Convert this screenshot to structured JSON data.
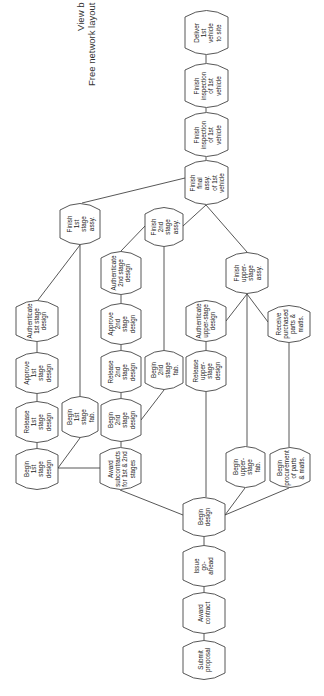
{
  "title": {
    "line1": "View b",
    "line2": "Free network layout"
  },
  "colors": {
    "stroke": "#444444",
    "text": "#222222",
    "background": "#ffffff"
  },
  "nodes": [
    {
      "id": "deliver",
      "label": "Deliver\n1st vehicle\nto site",
      "x": 185,
      "y": 10,
      "w": 43,
      "h": 45
    },
    {
      "id": "inspect1",
      "label": "Finish\ninspection\nof 1st\nvehicle",
      "x": 185,
      "y": 63,
      "w": 43,
      "h": 45
    },
    {
      "id": "inspect2",
      "label": "Finish\ninspection\nof 1st\nvehicle",
      "x": 185,
      "y": 112,
      "w": 43,
      "h": 45
    },
    {
      "id": "final",
      "label": "Finish\nfinal assy.\nof 1st\nvehicle",
      "x": 185,
      "y": 160,
      "w": 43,
      "h": 45
    },
    {
      "id": "fin1",
      "label": "Finish\n1st stage\nassy.",
      "x": 60,
      "y": 203,
      "w": 40,
      "h": 42
    },
    {
      "id": "fin2",
      "label": "Finish\n2nd stage\nassy.",
      "x": 145,
      "y": 207,
      "w": 38,
      "h": 40
    },
    {
      "id": "finup",
      "label": "Finish\nupper-stage\nassy.",
      "x": 226,
      "y": 252,
      "w": 42,
      "h": 42
    },
    {
      "id": "auth1",
      "label": "Authenticate\n1st stage\ndesign",
      "x": 16,
      "y": 300,
      "w": 42,
      "h": 42
    },
    {
      "id": "appr1",
      "label": "Approve\n1st stage\ndesign",
      "x": 16,
      "y": 352,
      "w": 42,
      "h": 42
    },
    {
      "id": "rel1",
      "label": "Release\n1st stage\ndesign",
      "x": 16,
      "y": 401,
      "w": 42,
      "h": 42
    },
    {
      "id": "beg1d",
      "label": "Begin\n1st stage\ndesign",
      "x": 16,
      "y": 448,
      "w": 42,
      "h": 42
    },
    {
      "id": "beg1f",
      "label": "Begin\n1st stage\nfab.",
      "x": 62,
      "y": 396,
      "w": 36,
      "h": 42
    },
    {
      "id": "auth2",
      "label": "Authenticate\n2nd stage\ndesign",
      "x": 101,
      "y": 251,
      "w": 40,
      "h": 44
    },
    {
      "id": "appr2",
      "label": "Approve\n2nd stage\ndesign",
      "x": 101,
      "y": 303,
      "w": 40,
      "h": 42
    },
    {
      "id": "rel2",
      "label": "Release\n2nd stage\ndesign",
      "x": 101,
      "y": 350,
      "w": 40,
      "h": 43
    },
    {
      "id": "beg2d",
      "label": "Begin\n2nd stage\ndesign",
      "x": 101,
      "y": 398,
      "w": 40,
      "h": 44
    },
    {
      "id": "award",
      "label": "Award\nsubcontracts\nfor 1st & 2nd\nstages",
      "x": 100,
      "y": 447,
      "w": 41,
      "h": 43
    },
    {
      "id": "beg2f",
      "label": "Begin\n2nd stage\nfab.",
      "x": 145,
      "y": 350,
      "w": 38,
      "h": 40
    },
    {
      "id": "authup",
      "label": "Authenticate\nupper-stage\ndesign",
      "x": 186,
      "y": 300,
      "w": 40,
      "h": 42
    },
    {
      "id": "relup",
      "label": "Release\nupper-stage\ndesign",
      "x": 186,
      "y": 350,
      "w": 40,
      "h": 42
    },
    {
      "id": "recv",
      "label": "Receive\npurchased\nparts &\nmatls.",
      "x": 268,
      "y": 305,
      "w": 42,
      "h": 38
    },
    {
      "id": "begupf",
      "label": "Begin\nupper-stage\nfab.",
      "x": 226,
      "y": 446,
      "w": 39,
      "h": 42
    },
    {
      "id": "proc",
      "label": "Begin\nprocurement\nof parts\n& matls.",
      "x": 270,
      "y": 447,
      "w": 40,
      "h": 41
    },
    {
      "id": "begdes",
      "label": "Begin\ndesign",
      "x": 183,
      "y": 497,
      "w": 42,
      "h": 40
    },
    {
      "id": "issue",
      "label": "Issue\ngo-ahead",
      "x": 183,
      "y": 545,
      "w": 42,
      "h": 42
    },
    {
      "id": "awardc",
      "label": "Award\ncontract",
      "x": 183,
      "y": 592,
      "w": 42,
      "h": 42
    },
    {
      "id": "submit",
      "label": "Submit\nproposal",
      "x": 183,
      "y": 640,
      "w": 42,
      "h": 40
    }
  ],
  "edges": [
    [
      206,
      55,
      206,
      63
    ],
    [
      206,
      108,
      206,
      112
    ],
    [
      206,
      157,
      206,
      160
    ],
    [
      185,
      178,
      82,
      203
    ],
    [
      206,
      205,
      183,
      226
    ],
    [
      206,
      205,
      247,
      252
    ],
    [
      80,
      245,
      38,
      300
    ],
    [
      80,
      245,
      80,
      396
    ],
    [
      37,
      342,
      37,
      352
    ],
    [
      37,
      394,
      37,
      401
    ],
    [
      37,
      443,
      37,
      448
    ],
    [
      80,
      438,
      58,
      468
    ],
    [
      58,
      468,
      100,
      468
    ],
    [
      145,
      226,
      121,
      251
    ],
    [
      164,
      247,
      164,
      350
    ],
    [
      121,
      295,
      121,
      303
    ],
    [
      121,
      345,
      121,
      350
    ],
    [
      121,
      393,
      121,
      398
    ],
    [
      121,
      442,
      121,
      447
    ],
    [
      164,
      390,
      141,
      420
    ],
    [
      120,
      490,
      183,
      515
    ],
    [
      247,
      294,
      226,
      321
    ],
    [
      247,
      294,
      268,
      322
    ],
    [
      247,
      294,
      247,
      446
    ],
    [
      206,
      342,
      206,
      350
    ],
    [
      206,
      392,
      206,
      497
    ],
    [
      289,
      343,
      289,
      447
    ],
    [
      225,
      515,
      245,
      488
    ],
    [
      225,
      515,
      289,
      488
    ],
    [
      204,
      537,
      204,
      545
    ],
    [
      204,
      587,
      204,
      592
    ],
    [
      204,
      634,
      204,
      640
    ]
  ]
}
